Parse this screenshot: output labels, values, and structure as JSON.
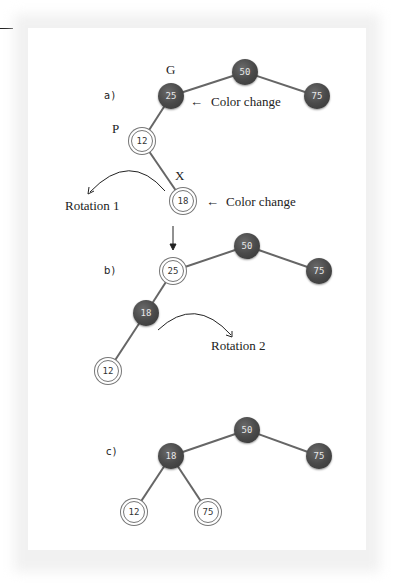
{
  "figure": {
    "parts": [
      {
        "label": "a)",
        "nodes": [
          {
            "id": "a-50",
            "value": "50",
            "color": "black"
          },
          {
            "id": "a-25",
            "value": "25",
            "color": "black",
            "tag": "G"
          },
          {
            "id": "a-75",
            "value": "75",
            "color": "black"
          },
          {
            "id": "a-12",
            "value": "12",
            "color": "red",
            "tag": "P"
          },
          {
            "id": "a-18",
            "value": "18",
            "color": "red",
            "tag": "X"
          }
        ],
        "annotations": [
          "Color change",
          "Color change",
          "Rotation 1"
        ]
      },
      {
        "label": "b)",
        "nodes": [
          {
            "id": "b-50",
            "value": "50",
            "color": "black"
          },
          {
            "id": "b-25",
            "value": "25",
            "color": "red"
          },
          {
            "id": "b-75",
            "value": "75",
            "color": "black"
          },
          {
            "id": "b-18",
            "value": "18",
            "color": "black"
          },
          {
            "id": "b-12",
            "value": "12",
            "color": "red"
          }
        ],
        "annotations": [
          "Rotation 2"
        ]
      },
      {
        "label": "c)",
        "nodes": [
          {
            "id": "c-50",
            "value": "50",
            "color": "black"
          },
          {
            "id": "c-18",
            "value": "18",
            "color": "black"
          },
          {
            "id": "c-75",
            "value": "75",
            "color": "black"
          },
          {
            "id": "c-12",
            "value": "12",
            "color": "red"
          },
          {
            "id": "c-75b",
            "value": "75",
            "color": "red"
          }
        ],
        "annotations": []
      }
    ],
    "tags": {
      "g": "G",
      "p": "P",
      "x": "X"
    },
    "text": {
      "color_change": "Color change",
      "color_change_arrow": "←",
      "rotation1": "Rotation 1",
      "rotation2": "Rotation 2"
    },
    "colors": {
      "black_node": "#4a4a4a",
      "red_node_fill": "#ffffff",
      "edge": "#666666"
    }
  }
}
